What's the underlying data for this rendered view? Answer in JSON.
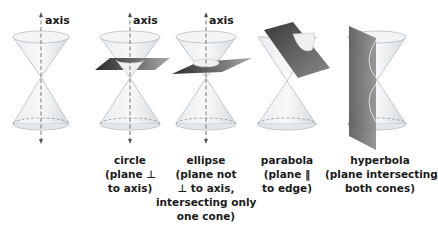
{
  "figure": {
    "panels": [
      {
        "id": "double-cone",
        "axis_label": "axis",
        "caption": []
      },
      {
        "id": "circle",
        "axis_label": "axis",
        "caption": [
          "circle",
          "(plane ⊥",
          "to axis)"
        ]
      },
      {
        "id": "ellipse",
        "axis_label": "axis",
        "caption": [
          "ellipse",
          "(plane not",
          "⊥ to axis,",
          "intersecting only",
          "one cone)"
        ]
      },
      {
        "id": "parabola",
        "axis_label": "",
        "caption": [
          "parabola",
          "(plane ‖",
          "to edge)"
        ]
      },
      {
        "id": "hyperbola",
        "axis_label": "",
        "caption": [
          "hyperbola",
          "(plane intersecting",
          "both cones)"
        ]
      }
    ]
  }
}
